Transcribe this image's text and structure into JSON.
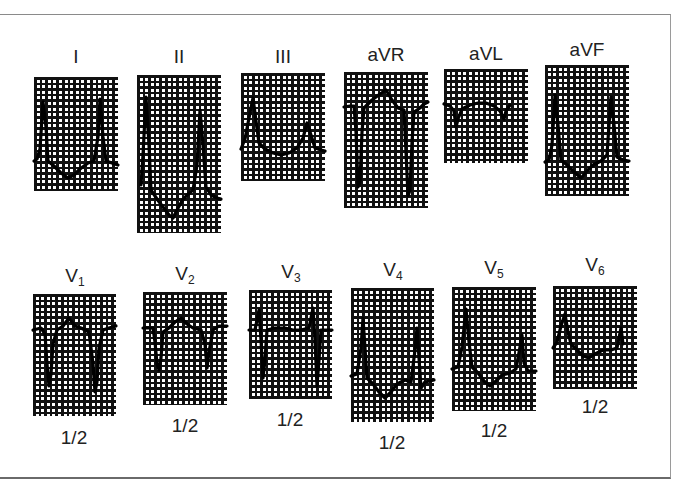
{
  "figure": {
    "rows": [
      {
        "name": "limb-leads",
        "leads": [
          {
            "id": "I",
            "label": "I",
            "sub": "",
            "calibration": ""
          },
          {
            "id": "II",
            "label": "II",
            "sub": "",
            "calibration": ""
          },
          {
            "id": "III",
            "label": "III",
            "sub": "",
            "calibration": ""
          },
          {
            "id": "aVR",
            "label": "aVR",
            "sub": "",
            "calibration": ""
          },
          {
            "id": "aVL",
            "label": "aVL",
            "sub": "",
            "calibration": ""
          },
          {
            "id": "aVF",
            "label": "aVF",
            "sub": "",
            "calibration": ""
          }
        ]
      },
      {
        "name": "precordial-leads",
        "leads": [
          {
            "id": "V1",
            "label": "V",
            "sub": "1",
            "calibration": "1/2"
          },
          {
            "id": "V2",
            "label": "V",
            "sub": "2",
            "calibration": "1/2"
          },
          {
            "id": "V3",
            "label": "V",
            "sub": "3",
            "calibration": "1/2"
          },
          {
            "id": "V4",
            "label": "V",
            "sub": "4",
            "calibration": "1/2"
          },
          {
            "id": "V5",
            "label": "V",
            "sub": "5",
            "calibration": "1/2"
          },
          {
            "id": "V6",
            "label": "V",
            "sub": "6",
            "calibration": "1/2"
          }
        ]
      }
    ]
  },
  "colors": {
    "grid": "#111111",
    "trace": "#000000",
    "background": "#ffffff",
    "frame": "#8a8a8a"
  }
}
